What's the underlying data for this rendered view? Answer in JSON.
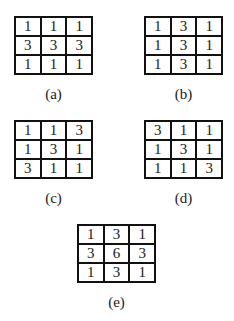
{
  "panels": [
    {
      "id": "a",
      "label": "(a)",
      "rows": [
        [
          "1",
          "1",
          "1"
        ],
        [
          "3",
          "3",
          "3"
        ],
        [
          "1",
          "1",
          "1"
        ]
      ]
    },
    {
      "id": "b",
      "label": "(b)",
      "rows": [
        [
          "1",
          "3",
          "1"
        ],
        [
          "1",
          "3",
          "1"
        ],
        [
          "1",
          "3",
          "1"
        ]
      ]
    },
    {
      "id": "c",
      "label": "(c)",
      "rows": [
        [
          "1",
          "1",
          "3"
        ],
        [
          "1",
          "3",
          "1"
        ],
        [
          "3",
          "1",
          "1"
        ]
      ]
    },
    {
      "id": "d",
      "label": "(d)",
      "rows": [
        [
          "3",
          "1",
          "1"
        ],
        [
          "1",
          "3",
          "1"
        ],
        [
          "1",
          "1",
          "3"
        ]
      ]
    },
    {
      "id": "e",
      "label": "(e)",
      "rows": [
        [
          "1",
          "3",
          "1"
        ],
        [
          "3",
          "6",
          "3"
        ],
        [
          "1",
          "3",
          "1"
        ]
      ]
    }
  ]
}
